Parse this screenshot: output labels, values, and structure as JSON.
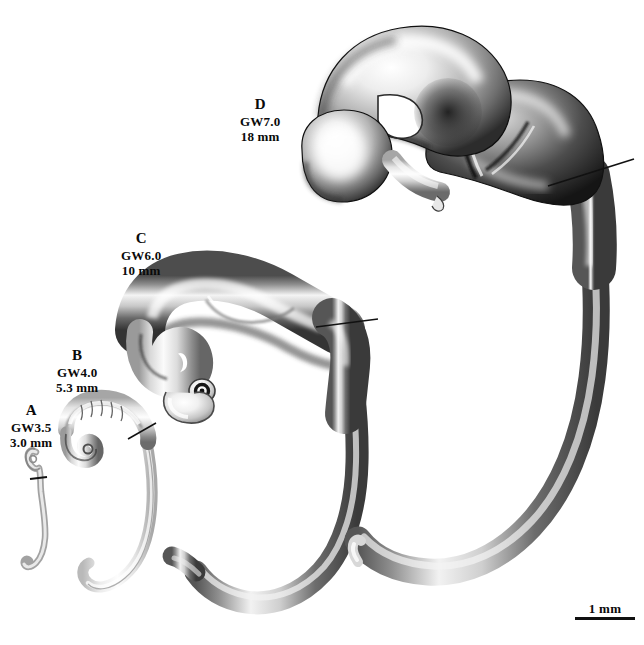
{
  "figure": {
    "background_color": "#ffffff",
    "ink_color": "#0a0a0a",
    "width": 644,
    "height": 645
  },
  "specimens": [
    {
      "id": "A",
      "letter": "A",
      "age": "GW3.5",
      "size": "3.0 mm",
      "label_x": 10,
      "label_y": 402
    },
    {
      "id": "B",
      "letter": "B",
      "age": "GW4.0",
      "size": "5.3 mm",
      "label_x": 56,
      "label_y": 347
    },
    {
      "id": "C",
      "letter": "C",
      "age": "GW6.0",
      "size": "10 mm",
      "label_x": 121,
      "label_y": 230
    },
    {
      "id": "D",
      "letter": "D",
      "age": "GW7.0",
      "size": "18 mm",
      "label_x": 240,
      "label_y": 96
    }
  ],
  "scale_bar": {
    "text": "1 mm",
    "x": 575,
    "y": 602,
    "width": 60
  }
}
